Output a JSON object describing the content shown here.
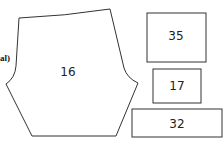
{
  "diagram": {
    "type": "sewing pattern pieces",
    "cut_text": "al)",
    "pieces": [
      {
        "id": "16",
        "label": "16",
        "shape": "polygon"
      },
      {
        "id": "35",
        "label": "35",
        "shape": "rectangle"
      },
      {
        "id": "17",
        "label": "17",
        "shape": "rectangle"
      },
      {
        "id": "32",
        "label": "32",
        "shape": "rectangle"
      }
    ],
    "colors": {
      "stroke": "#333333",
      "background": "#ffffff"
    }
  }
}
